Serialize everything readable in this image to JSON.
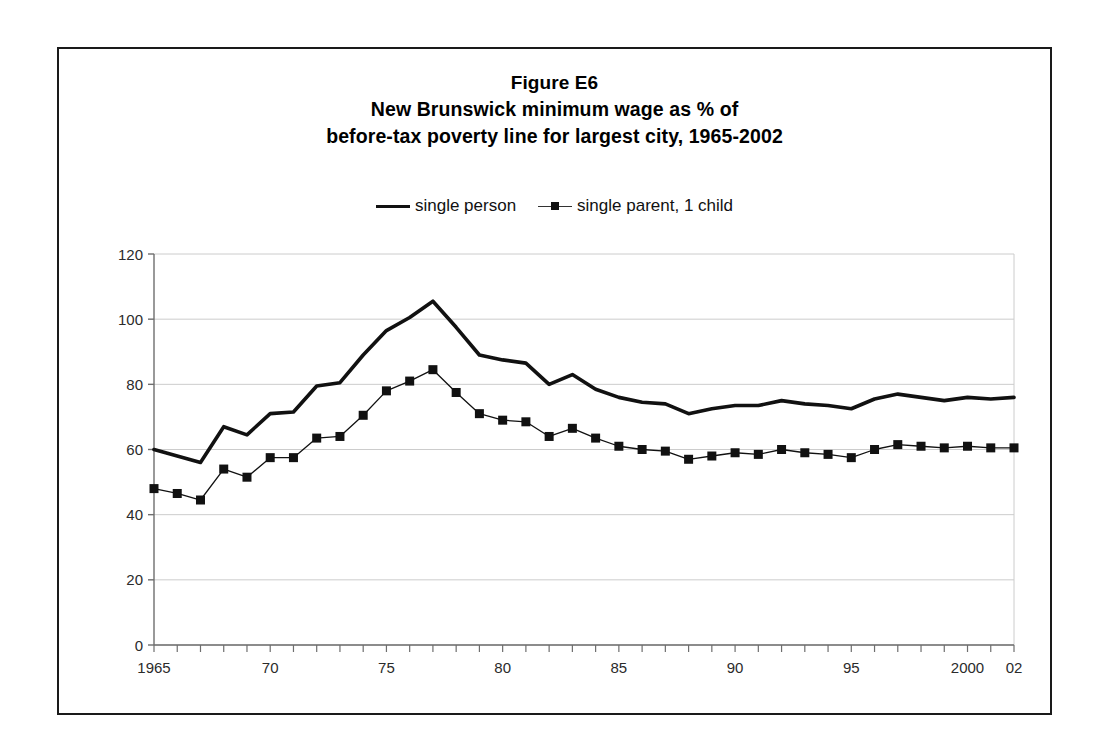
{
  "figure": {
    "title_lines": [
      "Figure E6",
      "New Brunswick minimum wage as % of",
      "before-tax poverty line for largest city, 1965-2002"
    ],
    "frame_color": "#1a1a1a"
  },
  "legend": {
    "position": "top-center",
    "entries": [
      {
        "label": "single person",
        "marker": "none",
        "color": "#111111"
      },
      {
        "label": "single parent, 1 child",
        "marker": "square",
        "color": "#111111"
      }
    ]
  },
  "chart_data": {
    "type": "line",
    "xlabel": "",
    "ylabel": "",
    "xlim": [
      1965,
      2002
    ],
    "ylim": [
      0,
      120
    ],
    "ytick_step": 20,
    "yticks": [
      0,
      20,
      40,
      60,
      80,
      100,
      120
    ],
    "grid": true,
    "grid_axis": "y",
    "x": [
      1965,
      1966,
      1967,
      1968,
      1969,
      1970,
      1971,
      1972,
      1973,
      1974,
      1975,
      1976,
      1977,
      1978,
      1979,
      1980,
      1981,
      1982,
      1983,
      1984,
      1985,
      1986,
      1987,
      1988,
      1989,
      1990,
      1991,
      1992,
      1993,
      1994,
      1995,
      1996,
      1997,
      1998,
      1999,
      2000,
      2001,
      2002
    ],
    "xtick_values": [
      1965,
      1970,
      1975,
      1980,
      1985,
      1990,
      1995,
      2000,
      2002
    ],
    "xtick_labels": [
      "1965",
      "70",
      "75",
      "80",
      "85",
      "90",
      "95",
      "2000",
      "02"
    ],
    "series": [
      {
        "name": "single person",
        "marker": "none",
        "color": "#111111",
        "line_width": 3.6,
        "values": [
          60.0,
          58.0,
          56.0,
          67.0,
          64.5,
          71.0,
          71.5,
          79.5,
          80.5,
          89.0,
          96.5,
          100.5,
          105.5,
          97.5,
          89.0,
          87.5,
          86.5,
          80.0,
          83.0,
          78.5,
          76.0,
          74.5,
          74.0,
          71.0,
          72.5,
          73.5,
          73.5,
          75.0,
          74.0,
          73.5,
          72.5,
          75.5,
          77.0,
          76.0,
          75.0,
          76.0,
          75.5,
          76.0
        ]
      },
      {
        "name": "single parent, 1 child",
        "marker": "square",
        "color": "#111111",
        "line_width": 1.3,
        "marker_size": 9,
        "values": [
          48.0,
          46.5,
          44.5,
          54.0,
          51.5,
          57.5,
          57.5,
          63.5,
          64.0,
          70.5,
          78.0,
          81.0,
          84.5,
          77.5,
          71.0,
          69.0,
          68.5,
          64.0,
          66.5,
          63.5,
          61.0,
          60.0,
          59.5,
          57.0,
          58.0,
          59.0,
          58.5,
          60.0,
          59.0,
          58.5,
          57.5,
          60.0,
          61.5,
          61.0,
          60.5,
          61.0,
          60.5,
          60.5
        ]
      }
    ]
  }
}
